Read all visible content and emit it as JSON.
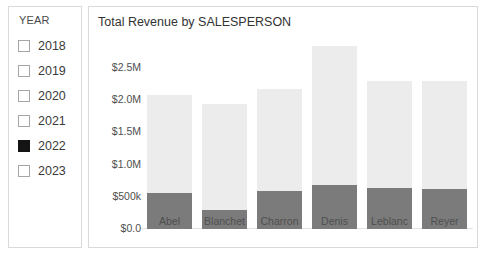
{
  "slicer": {
    "title": "YEAR",
    "items": [
      {
        "label": "2018",
        "checked": false
      },
      {
        "label": "2019",
        "checked": false
      },
      {
        "label": "2020",
        "checked": false
      },
      {
        "label": "2021",
        "checked": false
      },
      {
        "label": "2022",
        "checked": true
      },
      {
        "label": "2023",
        "checked": false
      }
    ]
  },
  "chart": {
    "title": "Total Revenue by SALESPERSON"
  },
  "chart_data": {
    "type": "bar",
    "title": "Total Revenue by SALESPERSON",
    "xlabel": "",
    "ylabel": "",
    "ylim": [
      0,
      2.75
    ],
    "grid": false,
    "stacked": true,
    "legend": "none",
    "y_tick_labels": [
      "$0.0",
      "$500k",
      "$1.0M",
      "$1.5M",
      "$2.0M",
      "$2.5M"
    ],
    "y_tick_values": [
      0,
      0.5,
      1.0,
      1.5,
      2.0,
      2.5
    ],
    "categories": [
      "Abel",
      "Blanchet",
      "Charron",
      "Denis",
      "Leblanc",
      "Reyer"
    ],
    "series": [
      {
        "name": "2022 (selected)",
        "color": "#7b7b7b",
        "values": [
          0.56,
          0.3,
          0.59,
          0.68,
          0.64,
          0.62
        ]
      },
      {
        "name": "Other years (faded)",
        "color": "#ececec",
        "values": [
          1.52,
          1.64,
          1.58,
          2.16,
          1.66,
          1.68
        ]
      }
    ],
    "totals": [
      2.08,
      1.94,
      2.17,
      2.84,
      2.3,
      2.3
    ],
    "units": "USD"
  },
  "colors": {
    "bar_faded": "#ececec",
    "bar_highlight": "#7b7b7b",
    "panel_border": "#d9d9d9",
    "text": "#3b3b3b"
  }
}
